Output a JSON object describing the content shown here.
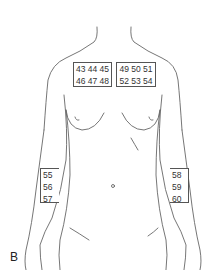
{
  "figure": {
    "panel_letter": "B",
    "colors": {
      "outline": "#555555",
      "text": "#333333",
      "background": "#ffffff"
    },
    "boxes": {
      "upper_left_chest": {
        "rows": [
          "43 44 45",
          "46 47 48"
        ]
      },
      "upper_right_chest": {
        "rows": [
          "49 50 51",
          "52 53 54"
        ]
      },
      "right_forearm_of_image_left": {
        "rows": [
          "55",
          "56",
          "57"
        ]
      },
      "left_forearm_of_image_right": {
        "rows": [
          "58",
          "59",
          "60"
        ]
      }
    }
  }
}
